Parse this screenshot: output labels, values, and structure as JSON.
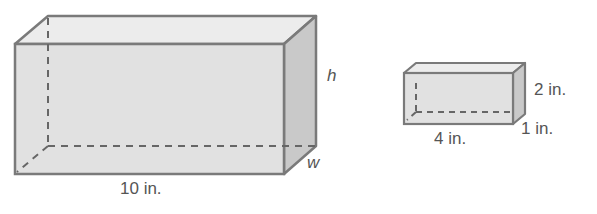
{
  "diagram": {
    "large_prism": {
      "length_label": "10 in.",
      "height_label": "h",
      "width_label": "w"
    },
    "small_prism": {
      "height_label": "2 in.",
      "length_label": "4 in.",
      "width_label": "1 in."
    },
    "colors": {
      "edge": "#7a7a7a",
      "front_face": "#dcdcdc",
      "top_face": "#ebebeb",
      "side_face": "#c8c8c8",
      "hidden_edge": "#666666",
      "label": "#555555"
    }
  }
}
